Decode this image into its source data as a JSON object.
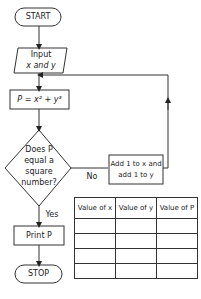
{
  "flowchart": {
    "start": "START",
    "input_line1": "Input",
    "input_line2": "x and y",
    "process": "P = x² + y³",
    "decision_line1": "Does P",
    "decision_line2": "equal a",
    "decision_line3": "square",
    "decision_line4": "number?",
    "no_label": "No",
    "yes_label": "Yes",
    "increment_line1": "Add 1 to x and",
    "increment_line2": "add 1 to y",
    "output": "Print P",
    "stop": "STOP"
  },
  "table": {
    "headers": [
      "Value of x",
      "Value of y",
      "Value of P"
    ],
    "rows": [
      [
        "",
        "",
        ""
      ],
      [
        "",
        "",
        ""
      ],
      [
        "",
        "",
        ""
      ],
      [
        "",
        "",
        ""
      ]
    ]
  }
}
